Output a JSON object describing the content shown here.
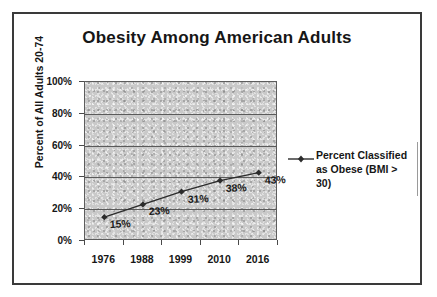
{
  "chart_data": {
    "type": "line",
    "title": "Obesity Among American Adults",
    "xlabel": "",
    "ylabel": "Percent of All Adults 20-74",
    "categories": [
      "1976",
      "1988",
      "1999",
      "2010",
      "2016"
    ],
    "values": [
      15,
      23,
      31,
      38,
      43
    ],
    "point_labels": [
      "15%",
      "23%",
      "31%",
      "38%",
      "43%"
    ],
    "ylim": [
      0,
      100
    ],
    "ytick_labels": [
      "0%",
      "20%",
      "40%",
      "60%",
      "80%",
      "100%"
    ],
    "ytick_values": [
      0,
      20,
      40,
      60,
      80,
      100
    ],
    "grid": true,
    "legend_position": "right",
    "series": [
      {
        "name": "Percent Classified as Obese (BMI > 30)",
        "values": [
          15,
          23,
          31,
          38,
          43
        ],
        "marker": "diamond",
        "color": "#2b2b2b"
      }
    ],
    "plot_background": "#c9c9c9",
    "page_background": "#ffffff"
  },
  "legend": {
    "line1": "Percent Classified",
    "line2": "as Obese (BMI > 30)"
  }
}
